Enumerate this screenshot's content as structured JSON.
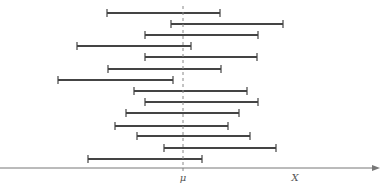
{
  "diagram": {
    "axis": {
      "label": "X",
      "y": 168,
      "x_start": 0,
      "x_end": 380,
      "color": "#777777"
    },
    "mean": {
      "label": "μ",
      "x": 183,
      "y_top": 6,
      "color": "#888888"
    },
    "interval_color": "#444444",
    "intervals": [
      {
        "y": 13,
        "x1": 107,
        "x2": 220
      },
      {
        "y": 24,
        "x1": 171,
        "x2": 283
      },
      {
        "y": 35,
        "x1": 145,
        "x2": 258
      },
      {
        "y": 46,
        "x1": 77,
        "x2": 191
      },
      {
        "y": 57,
        "x1": 145,
        "x2": 257
      },
      {
        "y": 69,
        "x1": 108,
        "x2": 221
      },
      {
        "y": 80,
        "x1": 58,
        "x2": 173
      },
      {
        "y": 91,
        "x1": 134,
        "x2": 247
      },
      {
        "y": 102,
        "x1": 145,
        "x2": 258
      },
      {
        "y": 113,
        "x1": 126,
        "x2": 239
      },
      {
        "y": 126,
        "x1": 115,
        "x2": 228
      },
      {
        "y": 136,
        "x1": 137,
        "x2": 250
      },
      {
        "y": 148,
        "x1": 164,
        "x2": 276
      },
      {
        "y": 159,
        "x1": 88,
        "x2": 202
      }
    ]
  }
}
